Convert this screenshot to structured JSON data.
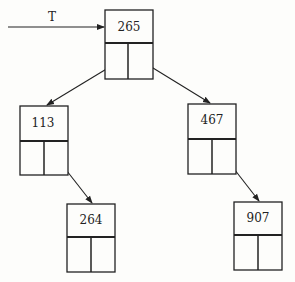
{
  "diagram": {
    "type": "binary-search-tree",
    "pointer": {
      "label": "T",
      "points_to": "265"
    },
    "nodes": [
      {
        "id": "root",
        "value": "265",
        "x": 105,
        "y": 10,
        "w": 48,
        "h": 69,
        "div": 33
      },
      {
        "id": "left",
        "value": "113",
        "x": 20,
        "y": 106,
        "w": 48,
        "h": 69,
        "div": 35
      },
      {
        "id": "right",
        "value": "467",
        "x": 188,
        "y": 104,
        "w": 48,
        "h": 70,
        "div": 35
      },
      {
        "id": "left-right",
        "value": "264",
        "x": 67,
        "y": 204,
        "w": 48,
        "h": 68,
        "div": 33
      },
      {
        "id": "right-right",
        "value": "907",
        "x": 234,
        "y": 202,
        "w": 48,
        "h": 68,
        "div": 33
      }
    ],
    "edges": [
      {
        "from": "265",
        "to": "113",
        "side": "left"
      },
      {
        "from": "265",
        "to": "467",
        "side": "right"
      },
      {
        "from": "113",
        "to": "264",
        "side": "right"
      },
      {
        "from": "467",
        "to": "907",
        "side": "right"
      }
    ]
  }
}
